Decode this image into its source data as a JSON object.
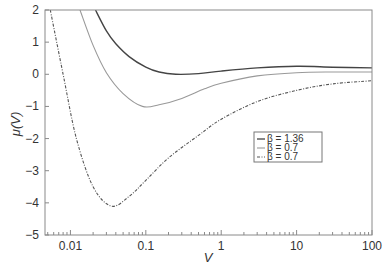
{
  "chart_data": {
    "type": "line",
    "title": "",
    "xlabel": "V",
    "ylabel": "μ(V)",
    "xscale": "log",
    "xlim": [
      0.0046,
      100
    ],
    "ylim": [
      -5,
      2
    ],
    "grid": false,
    "legend_position": "center-right",
    "x_ticks": [
      {
        "value": 0.01,
        "label": "0.01"
      },
      {
        "value": 0.1,
        "label": "0.1"
      },
      {
        "value": 1,
        "label": "1"
      },
      {
        "value": 10,
        "label": "10"
      },
      {
        "value": 100,
        "label": "100"
      }
    ],
    "y_ticks": [
      {
        "value": 2,
        "label": "2"
      },
      {
        "value": 1,
        "label": "1"
      },
      {
        "value": 0,
        "label": "0"
      },
      {
        "value": -1,
        "label": "−1"
      },
      {
        "value": -2,
        "label": "−2"
      },
      {
        "value": -3,
        "label": "−3"
      },
      {
        "value": -4,
        "label": "−4"
      },
      {
        "value": -5,
        "label": "−5"
      }
    ],
    "series": [
      {
        "name": "β = 1.36",
        "style": "solid",
        "color": "#444444",
        "x": [
          0.0215,
          0.03,
          0.04,
          0.06,
          0.1,
          0.15,
          0.25,
          0.5,
          1,
          3,
          10,
          30,
          100
        ],
        "y": [
          2.0,
          1.35,
          0.95,
          0.55,
          0.22,
          0.07,
          0.0,
          0.02,
          0.1,
          0.2,
          0.25,
          0.22,
          0.2
        ]
      },
      {
        "name": "β = 0.7",
        "style": "solid",
        "color": "#999999",
        "x": [
          0.0134,
          0.02,
          0.03,
          0.05,
          0.09,
          0.15,
          0.3,
          0.6,
          1,
          3,
          10,
          30,
          100
        ],
        "y": [
          2.0,
          0.9,
          0.05,
          -0.6,
          -1.0,
          -0.95,
          -0.75,
          -0.45,
          -0.28,
          -0.05,
          0.05,
          0.07,
          0.07
        ]
      },
      {
        "name": "β = 0.7",
        "style": "dash-dot",
        "color": "#555555",
        "x": [
          0.0054,
          0.008,
          0.012,
          0.02,
          0.035,
          0.06,
          0.1,
          0.2,
          0.5,
          1,
          3,
          10,
          30,
          100
        ],
        "y": [
          2.0,
          0.0,
          -2.0,
          -3.5,
          -4.1,
          -3.8,
          -3.3,
          -2.6,
          -1.9,
          -1.4,
          -0.85,
          -0.5,
          -0.3,
          -0.2
        ]
      }
    ]
  },
  "legend": {
    "items": [
      {
        "label": "β = 1.36"
      },
      {
        "label": "β = 0.7"
      },
      {
        "label": "β = 0.7"
      }
    ]
  }
}
